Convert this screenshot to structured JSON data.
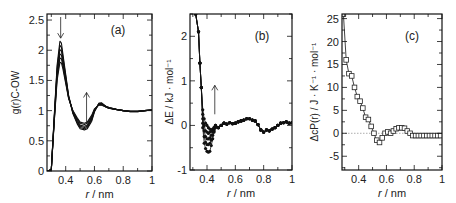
{
  "chart_data": [
    {
      "panel": "(a)",
      "type": "line",
      "xlabel": "r / nm",
      "ylabel": "g(r)C-OW",
      "xlim": [
        0.27,
        1.0
      ],
      "ylim": [
        0,
        2.6
      ],
      "xticks": [
        0.4,
        0.6,
        0.8,
        1
      ],
      "xtick_labels": [
        "0.4",
        "0.6",
        "0.8",
        "1"
      ],
      "yticks": [
        0,
        0.5,
        1,
        1.5,
        2,
        2.5
      ],
      "ytick_labels": [
        "0",
        "0.5",
        "1",
        "1.5",
        "2",
        "2.5"
      ],
      "grid": false,
      "annotations": [
        {
          "type": "arrow-down",
          "x": 0.365,
          "y_from": 2.55,
          "y_to": 2.2
        },
        {
          "type": "arrow-up",
          "x": 0.545,
          "y_from": 0.8,
          "y_to": 1.3
        }
      ],
      "x": [
        0.27,
        0.3,
        0.32,
        0.34,
        0.36,
        0.37,
        0.38,
        0.4,
        0.42,
        0.45,
        0.48,
        0.5,
        0.53,
        0.55,
        0.58,
        0.6,
        0.63,
        0.65,
        0.68,
        0.7,
        0.75,
        0.8,
        0.85,
        0.9,
        0.95,
        1.0
      ],
      "series": [
        {
          "name": "curve-1",
          "values": [
            0,
            0.02,
            0.9,
            1.75,
            2.15,
            2.12,
            1.95,
            1.6,
            1.25,
            0.95,
            0.78,
            0.7,
            0.68,
            0.7,
            0.82,
            0.98,
            1.12,
            1.13,
            1.07,
            1.05,
            1.02,
            1.0,
            0.98,
            0.98,
            1.0,
            1.01
          ]
        },
        {
          "name": "curve-2",
          "values": [
            0,
            0.02,
            0.88,
            1.7,
            2.08,
            2.05,
            1.9,
            1.57,
            1.24,
            0.96,
            0.8,
            0.72,
            0.7,
            0.72,
            0.84,
            0.99,
            1.12,
            1.12,
            1.07,
            1.05,
            1.02,
            1.0,
            0.98,
            0.98,
            1.0,
            1.01
          ]
        },
        {
          "name": "curve-3",
          "values": [
            0,
            0.02,
            0.86,
            1.65,
            2.01,
            1.99,
            1.85,
            1.54,
            1.23,
            0.97,
            0.82,
            0.74,
            0.72,
            0.74,
            0.86,
            1.0,
            1.11,
            1.11,
            1.07,
            1.05,
            1.02,
            1.0,
            0.99,
            0.99,
            1.0,
            1.01
          ]
        },
        {
          "name": "curve-4",
          "values": [
            0,
            0.02,
            0.84,
            1.6,
            1.94,
            1.92,
            1.8,
            1.51,
            1.22,
            0.98,
            0.84,
            0.76,
            0.74,
            0.76,
            0.88,
            1.01,
            1.1,
            1.1,
            1.06,
            1.04,
            1.02,
            1.0,
            0.99,
            0.99,
            1.0,
            1.01
          ]
        },
        {
          "name": "curve-5",
          "values": [
            0,
            0.02,
            0.82,
            1.55,
            1.87,
            1.86,
            1.75,
            1.48,
            1.21,
            0.99,
            0.86,
            0.79,
            0.77,
            0.79,
            0.9,
            1.02,
            1.1,
            1.1,
            1.06,
            1.04,
            1.02,
            1.0,
            0.99,
            0.99,
            1.0,
            1.01
          ]
        },
        {
          "name": "curve-6",
          "values": [
            0,
            0.02,
            0.8,
            1.5,
            1.8,
            1.79,
            1.7,
            1.45,
            1.2,
            1.0,
            0.88,
            0.81,
            0.79,
            0.81,
            0.92,
            1.03,
            1.09,
            1.09,
            1.06,
            1.04,
            1.02,
            1.0,
            0.99,
            0.99,
            1.0,
            1.01
          ]
        }
      ]
    },
    {
      "panel": "(b)",
      "type": "line",
      "xlabel": "r / nm",
      "ylabel": "ΔE / kJ · mol⁻¹",
      "xlim": [
        0.28,
        1.0
      ],
      "ylim": [
        -1,
        2.5
      ],
      "xticks": [
        0.4,
        0.6,
        0.8,
        1
      ],
      "xtick_labels": [
        "0.4",
        "0.6",
        "0.8",
        "1"
      ],
      "yticks": [
        -1,
        0,
        1,
        2
      ],
      "ytick_labels": [
        "-1",
        "0",
        "1",
        "2"
      ],
      "grid": false,
      "markers": "filled-circle",
      "annotations": [
        {
          "type": "arrow-up",
          "x": 0.455,
          "y_from": 0.25,
          "y_to": 0.9
        }
      ],
      "x": [
        0.32,
        0.34,
        0.35,
        0.36,
        0.37,
        0.38,
        0.39,
        0.4,
        0.41,
        0.42,
        0.43,
        0.44,
        0.45,
        0.46,
        0.48,
        0.5,
        0.52,
        0.54,
        0.56,
        0.58,
        0.6,
        0.62,
        0.64,
        0.66,
        0.68,
        0.7,
        0.72,
        0.74,
        0.76,
        0.78,
        0.8,
        0.82,
        0.84,
        0.86,
        0.88,
        0.9,
        0.92,
        0.94,
        0.96,
        0.98,
        1.0
      ],
      "series": [
        {
          "name": "curve-1",
          "values": [
            2.5,
            2.1,
            1.4,
            0.85,
            0.35,
            0.15,
            0.05,
            0.0,
            -0.05,
            -0.08,
            -0.1,
            -0.08,
            -0.05,
            0.0,
            -0.05,
            0.0,
            0.05,
            0.03,
            0.06,
            0.04,
            0.05,
            0.08,
            0.1,
            0.12,
            0.15,
            0.15,
            0.12,
            0.1,
            0.02,
            -0.1,
            -0.15,
            -0.1,
            -0.12,
            -0.08,
            -0.05,
            0.0,
            0.05,
            0.06,
            0.08,
            0.05,
            0.06
          ]
        },
        {
          "name": "curve-2",
          "values": [
            2.5,
            2.1,
            1.4,
            0.85,
            0.25,
            0.0,
            -0.12,
            -0.15,
            -0.18,
            -0.15,
            -0.12,
            -0.1,
            -0.05,
            0.0,
            -0.05,
            0.0,
            0.05,
            0.03,
            0.06,
            0.04,
            0.05,
            0.08,
            0.1,
            0.12,
            0.15,
            0.15,
            0.12,
            0.1,
            0.02,
            -0.1,
            -0.15,
            -0.1,
            -0.12,
            -0.08,
            -0.05,
            0.0,
            0.05,
            0.06,
            0.08,
            0.05,
            0.06
          ]
        },
        {
          "name": "curve-3",
          "values": [
            2.5,
            2.1,
            1.4,
            0.85,
            0.15,
            -0.12,
            -0.25,
            -0.3,
            -0.3,
            -0.28,
            -0.22,
            -0.15,
            -0.08,
            0.0,
            -0.05,
            0.0,
            0.05,
            0.03,
            0.06,
            0.04,
            0.05,
            0.08,
            0.1,
            0.12,
            0.15,
            0.15,
            0.12,
            0.1,
            0.02,
            -0.1,
            -0.15,
            -0.1,
            -0.12,
            -0.08,
            -0.05,
            0.0,
            0.05,
            0.06,
            0.08,
            0.05,
            0.06
          ]
        },
        {
          "name": "curve-4",
          "values": [
            2.5,
            2.1,
            1.4,
            0.85,
            0.05,
            -0.25,
            -0.38,
            -0.43,
            -0.43,
            -0.4,
            -0.33,
            -0.22,
            -0.12,
            -0.02,
            -0.05,
            0.0,
            0.05,
            0.03,
            0.06,
            0.04,
            0.05,
            0.08,
            0.1,
            0.12,
            0.15,
            0.15,
            0.12,
            0.1,
            0.02,
            -0.1,
            -0.15,
            -0.1,
            -0.12,
            -0.08,
            -0.05,
            0.0,
            0.05,
            0.06,
            0.08,
            0.05,
            0.06
          ]
        },
        {
          "name": "curve-5",
          "values": [
            2.5,
            2.1,
            1.4,
            0.85,
            -0.05,
            -0.4,
            -0.52,
            -0.58,
            -0.6,
            -0.58,
            -0.45,
            -0.3,
            -0.15,
            -0.05,
            -0.05,
            0.0,
            0.05,
            0.03,
            0.06,
            0.04,
            0.05,
            0.08,
            0.1,
            0.12,
            0.15,
            0.15,
            0.12,
            0.1,
            0.02,
            -0.1,
            -0.15,
            -0.1,
            -0.12,
            -0.08,
            -0.05,
            0.0,
            0.05,
            0.06,
            0.08,
            0.05,
            0.06
          ]
        }
      ]
    },
    {
      "panel": "(c)",
      "type": "line",
      "xlabel": "r / nm",
      "ylabel": "ΔcP(r) / J · K⁻¹ · mol⁻¹",
      "xlim": [
        0.28,
        1.0
      ],
      "ylim": [
        -8,
        26
      ],
      "xticks": [
        0.4,
        0.6,
        0.8,
        1
      ],
      "xtick_labels": [
        "0.4",
        "0.6",
        "0.8",
        "1"
      ],
      "yticks": [
        -5,
        0,
        5,
        10,
        15,
        20,
        25
      ],
      "ytick_labels": [
        "-5",
        "0",
        "5",
        "10",
        "15",
        "20",
        "25"
      ],
      "grid": false,
      "markers": "open-square",
      "reference_line": {
        "y": 0,
        "style": "dotted"
      },
      "x": [
        0.29,
        0.31,
        0.33,
        0.35,
        0.37,
        0.39,
        0.41,
        0.43,
        0.45,
        0.47,
        0.49,
        0.51,
        0.53,
        0.55,
        0.57,
        0.59,
        0.61,
        0.63,
        0.65,
        0.67,
        0.69,
        0.71,
        0.73,
        0.75,
        0.77,
        0.79,
        0.81,
        0.83,
        0.85,
        0.87,
        0.89,
        0.91,
        0.93,
        0.95,
        0.97,
        0.99
      ],
      "values": [
        26,
        16,
        13,
        12.5,
        10,
        8,
        7,
        5.5,
        3.5,
        3,
        1.5,
        0,
        -1.5,
        -2,
        -1,
        0,
        0.3,
        0,
        0.5,
        1,
        1.2,
        1.2,
        1.1,
        0.5,
        0,
        -0.5,
        -0.5,
        -0.5,
        -0.5,
        -0.5,
        -0.5,
        -0.5,
        -0.5,
        -0.5,
        -0.5,
        -0.5
      ]
    }
  ]
}
